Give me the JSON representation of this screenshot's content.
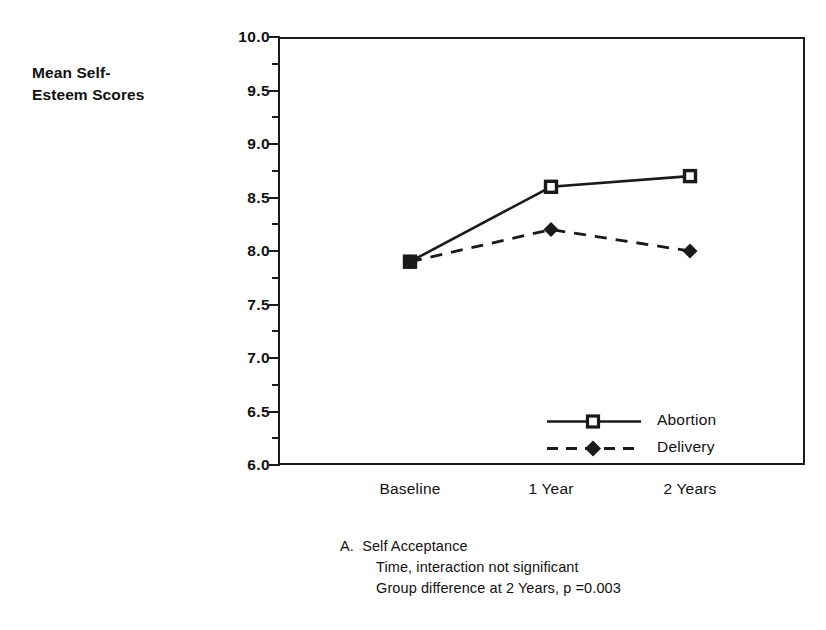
{
  "chart_data": {
    "type": "line",
    "title": "",
    "xlabel": "",
    "ylabel": "Mean Self-Esteem Scores",
    "categories": [
      "Baseline",
      "1 Year",
      "2 Years"
    ],
    "series": [
      {
        "name": "Abortion",
        "values": [
          7.9,
          8.6,
          8.7
        ],
        "linestyle": "solid",
        "marker": "open-square"
      },
      {
        "name": "Delivery",
        "values": [
          7.9,
          8.2,
          8.0
        ],
        "linestyle": "dashed",
        "marker": "filled-diamond"
      }
    ],
    "ylim": [
      6.0,
      10.0
    ],
    "ytick_labels": [
      "10.0",
      "9.5",
      "9.0",
      "8.5",
      "8.0",
      "7.5",
      "7.0",
      "6.5",
      "6.0"
    ],
    "ytick_values": [
      10.0,
      9.5,
      9.0,
      8.5,
      8.0,
      7.5,
      7.0,
      6.5,
      6.0
    ],
    "yminor_values": [
      9.75,
      9.25,
      8.75,
      8.25,
      7.75,
      7.25,
      6.75,
      6.25
    ],
    "grid": false,
    "legend_position": "lower-right-inside",
    "annotations": [
      "A.  Self Acceptance",
      "Time, interaction not significant",
      "Group difference at 2 Years, p =0.003"
    ]
  },
  "axis": {
    "y_title_line1": "Mean Self-",
    "y_title_line2": "Esteem Scores"
  },
  "legend": {
    "items": [
      {
        "label": "Abortion"
      },
      {
        "label": "Delivery"
      }
    ]
  },
  "caption": {
    "line1": "A.  Self Acceptance",
    "line2": "Time, interaction not significant",
    "line3": "Group difference at 2 Years, p =0.003"
  },
  "colors": {
    "ink": "#1a1a1a",
    "background": "#ffffff"
  }
}
